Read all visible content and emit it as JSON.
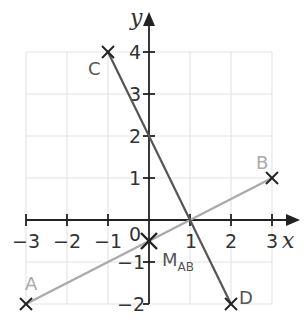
{
  "diagram": {
    "type": "coordinate-plane",
    "axes": {
      "x_label": "x",
      "y_label": "y",
      "x_ticks": [
        "−3",
        "−2",
        "−1",
        "1",
        "2",
        "3"
      ],
      "y_ticks": [
        "4",
        "3",
        "2",
        "1",
        "−1",
        "−2"
      ],
      "origin_label": "0",
      "x_range": [
        -3,
        3
      ],
      "y_range": [
        -2,
        4
      ]
    },
    "points": {
      "A": {
        "label": "A",
        "x": -3,
        "y": -2
      },
      "B": {
        "label": "B",
        "x": 3,
        "y": 1
      },
      "C": {
        "label": "C",
        "x": -1,
        "y": 4
      },
      "D": {
        "label": "D",
        "x": 2,
        "y": -2
      },
      "M": {
        "label": "M",
        "sub": "AB",
        "x": 0,
        "y": -0.5
      }
    },
    "segments": [
      {
        "from": "A",
        "to": "B",
        "color": "#aaaaaa"
      },
      {
        "from": "C",
        "to": "D",
        "color": "#555555"
      }
    ],
    "intersection": {
      "x": 1,
      "y": 0
    },
    "colors": {
      "grid": "#e4e4e4",
      "axis": "#222222",
      "segment_ab": "#aaaaaa",
      "segment_cd": "#555555",
      "label_light": "#aaaaaa",
      "label_dark": "#555555"
    }
  }
}
